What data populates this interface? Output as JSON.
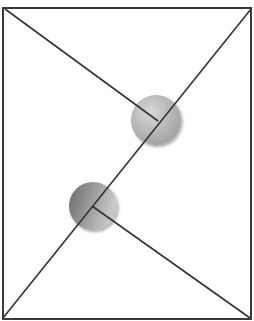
{
  "diagram": {
    "canvas": {
      "width": 254,
      "height": 321,
      "background": "#ffffff"
    },
    "frame": {
      "x": 3,
      "y": 8,
      "width": 248,
      "height": 311,
      "stroke": "#3a3a3a",
      "stroke_width": 2
    },
    "line_color": "#333333",
    "lines": [
      {
        "id": "upper-left-line",
        "x1": 5,
        "y1": 9,
        "x2": 158,
        "y2": 121
      },
      {
        "id": "long-diagonal",
        "x1": 3,
        "y1": 318,
        "x2": 251,
        "y2": 9
      },
      {
        "id": "lower-right-line",
        "x1": 92,
        "y1": 206,
        "x2": 250,
        "y2": 318
      }
    ],
    "circles": [
      {
        "id": "upper-circle",
        "cx": 156,
        "cy": 120,
        "r": 25,
        "color_light": "#cfcfcf",
        "color_dark": "#9a9a9a"
      },
      {
        "id": "lower-circle",
        "cx": 93,
        "cy": 206,
        "r": 24,
        "color_light": "#c4c4c4",
        "color_dark": "#6e6e6e"
      }
    ]
  }
}
